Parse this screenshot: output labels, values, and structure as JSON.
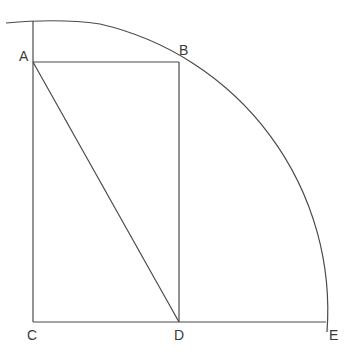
{
  "diagram": {
    "type": "geometric-construction",
    "stroke_color": "#4a4a4a",
    "background": "#ffffff",
    "points": {
      "A": {
        "label": "A",
        "x": 33,
        "y": 62
      },
      "B": {
        "label": "B",
        "x": 179,
        "y": 62
      },
      "C": {
        "label": "C",
        "x": 33,
        "y": 322
      },
      "D": {
        "label": "D",
        "x": 179,
        "y": 322
      },
      "E": {
        "label": "E",
        "x": 326,
        "y": 322
      }
    },
    "segments": [
      {
        "from": "A",
        "to": "B"
      },
      {
        "from": "B",
        "to": "D"
      },
      {
        "from": "A",
        "to": "D"
      },
      {
        "from": "C",
        "to": "E"
      },
      {
        "from": "C",
        "to": "top-of-vertical"
      }
    ],
    "arc": {
      "center": "C",
      "radius": 294,
      "description": "quarter circle from above A through B to E"
    }
  },
  "labels": {
    "A": "A",
    "B": "B",
    "C": "C",
    "D": "D",
    "E": "E"
  }
}
